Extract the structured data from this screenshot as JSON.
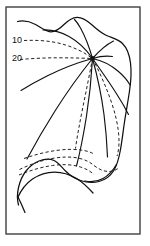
{
  "figure": {
    "type": "line-drawing",
    "background_color": "#ffffff",
    "ink_color": "#111111",
    "frame_color": "#4a4a4a",
    "width": 150,
    "height": 246,
    "frame": {
      "x": 6,
      "y": 7,
      "width": 134,
      "height": 227
    },
    "node": {
      "label": "vein-convergence-node",
      "x": 92.5,
      "y": 58.5,
      "radius": 2.4
    },
    "labels": [
      {
        "name": "contour-label-10",
        "text": "10",
        "x": 12,
        "y": 43
      },
      {
        "name": "contour-label-20",
        "text": "20",
        "x": 12,
        "y": 61
      }
    ],
    "outline": {
      "name": "leaf-outline",
      "d": "M 17.5 21.5 C 24 20.2 30 21.5 35.5 24.5 C 41 27.6 45.5 31.5 50.5 31.8 C 56 32.1 60 28.5 64 24.5 C 68 20.6 72 17.5 77 17.3 C 82.5 17.1 87 20.5 91.5 24.5 C 96.5 29 101 33 106.5 35.5 C 112 38 118 39 122.5 43.5 C 127 48 129.5 55 130.5 63 C 131.6 71.5 131 81 129.5 91 C 128 101.5 126 112 124.5 122 C 123 132 122 141 120.5 149.5 C 119 158 117 165.5 113.5 171 C 110 176.5 105 180 99 181.5 C 93 183 86.5 182.5 80.5 180.5 C 74.5 178.5 69.5 175 65.5 171 C 61.5 167 58.5 162.5 54 160.5 C 49.5 158.5 44 159 39 161 C 34 163 29.5 166.5 26 171 C 22.5 175.5 20 181 18.5 187.5 C 17.2 193.5 17 199.5 18.5 205"
    },
    "outline_secondary": {
      "name": "leaf-outline-lower-fold",
      "d": "M 17.5 198 C 21 190 26 183.5 32.5 179 C 39 174.5 46.5 172 54.5 172 C 62.5 172 70 174.5 76.5 178.5 C 83 182.5 88.5 188 93 193"
    },
    "outline_tail": {
      "name": "leaf-outline-tail",
      "d": "M 17.5 196 C 20 201 22.5 206.5 25 212.5"
    },
    "outline_inner_right": {
      "name": "leaf-outline-inner-right-margin",
      "d": "M 116.5 164.5 C 113 170.5 108.5 175.5 103 178.5 C 97.5 181.5 91 182.5 85 181"
    },
    "veins": [
      {
        "name": "vein-upper-right-short",
        "d": "M 92.5 58.5 C 99 56.5 106 55.5 112.5 56.5"
      },
      {
        "name": "vein-upper-right-arc",
        "d": "M 92.5 58.5 C 99.5 50.5 106.5 44.5 113.5 41"
      },
      {
        "name": "vein-top-center",
        "d": "M 92.5 58.5 C 89.5 48 85.5 37 80.5 28 C 78.5 24.5 76.5 21.5 74.5 19.5"
      },
      {
        "name": "vein-top-left-curve",
        "d": "M 92.5 58.5 C 86 49 78 41.5 69 36.5 C 60.5 31.8 51.5 29.5 43 30"
      },
      {
        "name": "vein-left-upper",
        "d": "M 92.5 58.5 C 78 62.5 62 68.5 47 76 C 38 80.5 29 85.5 21 90.5"
      },
      {
        "name": "vein-left-lower",
        "d": "M 92.5 58.5 C 80 74 67 92 55 111 C 44.5 127.5 35 144 27 159"
      },
      {
        "name": "vein-center-down",
        "d": "M 92.5 58.5 C 91.5 77 89.5 97 86.5 116 C 83.5 135 80 152.5 76.5 166"
      },
      {
        "name": "vein-right-down",
        "d": "M 92.5 58.5 C 97.5 76.5 101.5 95.5 104 114.5 C 106 130 107 144.5 107.5 157"
      },
      {
        "name": "vein-right-outer",
        "d": "M 92.5 58.5 C 101 70.5 109.5 82.5 117 94.5 C 121.5 101.5 125.5 108.5 128.5 114.5"
      },
      {
        "name": "vein-right-upper-outer",
        "d": "M 92.5 58.5 C 102 60.5 111 65 118.5 71.5 C 123.5 75.8 127.5 80.5 130 85"
      }
    ],
    "contours": [
      {
        "name": "contour-line-10",
        "value": 10,
        "d": "M 24 40.5 C 34 40 44 40.5 53 42 C 62.5 43.6 71 46.5 78.5 50 C 84 52.6 88.5 55.5 92 58.5"
      },
      {
        "name": "contour-line-20",
        "value": 20,
        "d": "M 20 59.5 C 32 58.5 45 57.8 57 57.8 C 68.5 57.8 79 58 87 58.3 C 89.5 58.4 91 58.5 92 58.5"
      },
      {
        "name": "contour-vein-center-dashed",
        "d": "M 92.5 58.5 C 89.5 74.5 86 92 82.5 109 C 79.5 124 77 137.5 75.5 148.5"
      },
      {
        "name": "contour-vein-right-dashed",
        "d": "M 92.5 58.5 C 99.5 72 106 86.5 111 101 C 115 112.5 117.5 123 118.5 132.5 C 119.5 142 119 150 117 156"
      },
      {
        "name": "contour-lower-upper-band",
        "d": "M 24 158.5 C 34 155 45 152 56 150.5 C 66.5 149 76 149 84 150.5 C 88 151.3 91 152.3 93 153.5"
      },
      {
        "name": "contour-lower-mid-band",
        "d": "M 19.5 169.5 C 30 164.5 41 160.5 52 158.5 C 62.5 156.6 72 156.5 80 158.5 C 86 160 90.5 162.5 94 165.5"
      },
      {
        "name": "contour-lower-bottom-band",
        "d": "M 19 175 C 30 170.5 41.5 167 52.5 165.5 C 63 164 72.5 164.5 80.5 167 C 86 168.7 90.5 171.3 94 174.5"
      },
      {
        "name": "contour-bottom-right-hook",
        "d": "M 94 165.5 C 99 169.5 104 171.5 109 171.5 C 113 171.5 116.5 170 119 167.5"
      }
    ]
  }
}
